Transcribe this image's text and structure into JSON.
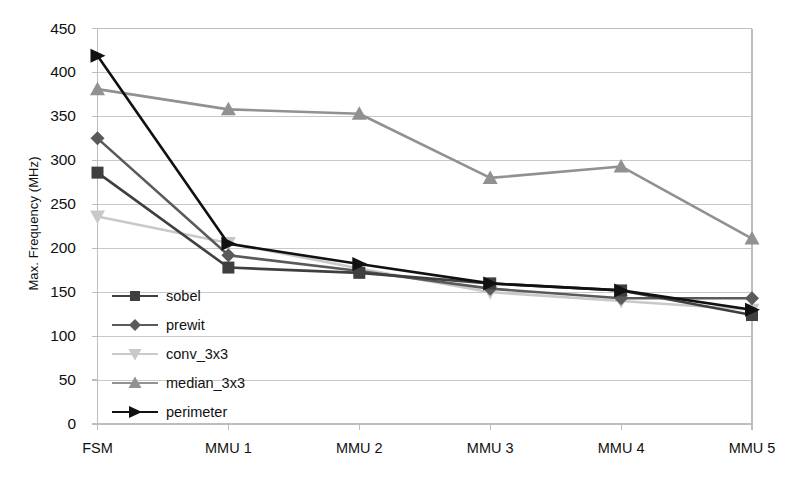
{
  "chart_data": {
    "type": "line",
    "title": "",
    "xlabel": "",
    "ylabel": "Max. Frequency (MHz)",
    "categories": [
      "FSM",
      "MMU 1",
      "MMU 2",
      "MMU 3",
      "MMU 4",
      "MMU 5"
    ],
    "ylim": [
      0,
      450
    ],
    "ytick_step": 50,
    "yticks": [
      0,
      50,
      100,
      150,
      200,
      250,
      300,
      350,
      400,
      450
    ],
    "ytick_labels": [
      "0",
      "50",
      "100",
      "150",
      "200",
      "250",
      "300",
      "350",
      "400",
      "450"
    ],
    "grid": "horizontal",
    "legend_position": "inside-lower-left",
    "series": [
      {
        "name": "sobel",
        "marker": "square",
        "color": "#3f3f3f",
        "values": [
          286,
          178,
          172,
          160,
          152,
          124
        ]
      },
      {
        "name": "prewit",
        "marker": "diamond",
        "color": "#5a5a5a",
        "values": [
          325,
          192,
          174,
          154,
          143,
          143
        ]
      },
      {
        "name": "conv_3x3",
        "marker": "triangle-down",
        "color": "#c9c9c9",
        "values": [
          236,
          206,
          177,
          150,
          140,
          130
        ]
      },
      {
        "name": "median_3x3",
        "marker": "triangle-up",
        "color": "#919191",
        "values": [
          381,
          358,
          353,
          280,
          293,
          211
        ]
      },
      {
        "name": "perimeter",
        "marker": "arrow-right",
        "color": "#111111",
        "values": [
          419,
          205,
          182,
          160,
          152,
          130
        ]
      }
    ]
  },
  "axis": {
    "y_title": "Max. Frequency (MHz)"
  },
  "legend": {
    "items": [
      {
        "label": "sobel"
      },
      {
        "label": "prewit"
      },
      {
        "label": "conv_3x3"
      },
      {
        "label": "median_3x3"
      },
      {
        "label": "perimeter"
      }
    ]
  },
  "colors": {
    "plot_border": "#bdbdbd",
    "gridline": "#c8c8c8",
    "background": "#ffffff",
    "text": "#111111"
  }
}
